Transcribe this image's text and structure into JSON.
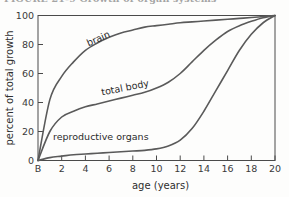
{
  "caption": {
    "text": "FIGURE 21-9   Growth of organ systems"
  },
  "chart_data": {
    "type": "line",
    "title": "",
    "xlabel": "age (years)",
    "ylabel": "percent of total growth",
    "xlim": [
      0,
      20
    ],
    "ylim": [
      0,
      100
    ],
    "grid": false,
    "legend_position": "inline-curve-labels",
    "x_tick_labels": [
      "B",
      "2",
      "4",
      "6",
      "8",
      "10",
      "12",
      "14",
      "16",
      "18",
      "20"
    ],
    "x_tick_values": [
      0,
      2,
      4,
      6,
      8,
      10,
      12,
      14,
      16,
      18,
      20
    ],
    "y_tick_labels": [
      "0",
      "20",
      "40",
      "60",
      "80",
      "100"
    ],
    "y_tick_values": [
      0,
      20,
      40,
      60,
      80,
      100
    ],
    "x": [
      0,
      1,
      2,
      3,
      4,
      5,
      6,
      7,
      8,
      9,
      10,
      11,
      12,
      13,
      14,
      15,
      16,
      17,
      18,
      19,
      20
    ],
    "series": [
      {
        "name": "brain",
        "label": "brain",
        "color": "#5a5a5a",
        "values": [
          0,
          42,
          58,
          68,
          76,
          81,
          85,
          88,
          90,
          92,
          93,
          94,
          95,
          95.6,
          96.2,
          96.8,
          97.4,
          98,
          98.6,
          99.3,
          100
        ]
      },
      {
        "name": "total body",
        "label": "total body",
        "color": "#5a5a5a",
        "values": [
          0,
          20,
          30,
          34,
          37,
          39,
          41,
          43,
          45,
          47,
          50,
          54,
          60,
          68,
          76,
          83,
          89,
          93,
          96,
          98.5,
          100
        ]
      },
      {
        "name": "reproductive organs",
        "label": "reproductive organs",
        "color": "#5a5a5a",
        "values": [
          0,
          2,
          3,
          4,
          4.5,
          5,
          5.5,
          6,
          6.5,
          7,
          8,
          10,
          14,
          22,
          34,
          48,
          62,
          76,
          87,
          95,
          100
        ]
      }
    ],
    "annotations": [
      {
        "name": "brain",
        "text": "brain",
        "x": 5.2,
        "y": 82,
        "rotation": -24
      },
      {
        "name": "total-body",
        "text": "total body",
        "x": 7.4,
        "y": 48,
        "rotation": -11
      },
      {
        "name": "reproductive-organs",
        "text": "reproductive organs",
        "x": 5.3,
        "y": 14,
        "rotation": 0
      }
    ]
  },
  "colors": {
    "curve": "#5a5a5a",
    "axis": "#4a4a4a",
    "text": "#2b2b2b",
    "background": "#fdfdfc"
  }
}
